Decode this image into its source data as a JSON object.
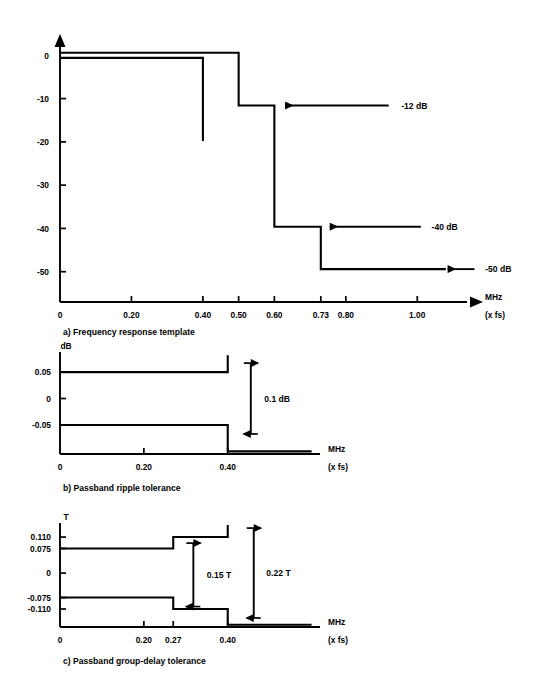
{
  "figure": {
    "title_visible": "",
    "stroke_color": "#000000",
    "background_color": "#ffffff"
  },
  "chart_data": [
    {
      "id": "a",
      "type": "line",
      "title": "a) Frequency response template",
      "caption": "a) Frequency response template",
      "xlabel": "MHz",
      "xlabel_sub": "(x fs)",
      "ylabel": "",
      "xticks": [
        0,
        0.2,
        0.4,
        0.5,
        0.6,
        0.73,
        0.8,
        1.0
      ],
      "xticklabels": [
        "0",
        "0.20",
        "0.40",
        "0.50",
        "0.60",
        "0.73",
        "0.80",
        "1.00"
      ],
      "yticks": [
        0,
        -10,
        -20,
        -30,
        -40,
        -50
      ],
      "yticklabels": [
        "0",
        "-10",
        "-20",
        "-30",
        "-40",
        "-50"
      ],
      "xlim": [
        0,
        1.1
      ],
      "ylim": [
        -57,
        4
      ],
      "grid": false,
      "legend": "none",
      "series": [
        {
          "name": "upper-mask",
          "points": [
            [
              0,
              0.6
            ],
            [
              0.5,
              0.6
            ],
            [
              0.5,
              -11.6
            ],
            [
              0.6,
              -11.6
            ],
            [
              0.6,
              -39.6
            ],
            [
              0.73,
              -39.6
            ],
            [
              0.73,
              -49.4
            ],
            [
              1.08,
              -49.4
            ]
          ]
        },
        {
          "name": "lower-mask",
          "points": [
            [
              0,
              -0.6
            ],
            [
              0.4,
              -0.6
            ],
            [
              0.4,
              -19.8
            ]
          ]
        }
      ],
      "annotations": [
        {
          "text": "-12 dB",
          "value": -12,
          "arrow_from_x": 0.92,
          "arrow_to_x": 0.63,
          "y": -11.6,
          "label_x": 0.955
        },
        {
          "text": "-40 dB",
          "value": -40,
          "arrow_from_x": 1.01,
          "arrow_to_x": 0.755,
          "y": -39.6,
          "label_x": 1.04
        },
        {
          "text": "-50 dB",
          "value": -50,
          "arrow_from_x": 1.16,
          "arrow_to_x": 1.085,
          "y": -49.4,
          "label_x": 1.19
        }
      ]
    },
    {
      "id": "b",
      "type": "line",
      "title": "b) Passband ripple tolerance",
      "caption": "b) Passband ripple tolerance",
      "xlabel": "MHz",
      "xlabel_sub": "(x fs)",
      "ylabel": "dB",
      "xticks": [
        0,
        0.2,
        0.4
      ],
      "xticklabels": [
        "0",
        "0.20",
        "0.40"
      ],
      "yticks": [
        0.05,
        0,
        -0.05
      ],
      "yticklabels": [
        "0.05",
        "0",
        "-0.05"
      ],
      "xlim": [
        0,
        0.62
      ],
      "ylim": [
        -0.105,
        0.088
      ],
      "grid": false,
      "legend": "none",
      "series": [
        {
          "name": "upper-ripple",
          "points": [
            [
              0,
              0.05
            ],
            [
              0.4,
              0.05
            ],
            [
              0.4,
              0.082
            ]
          ]
        },
        {
          "name": "lower-ripple",
          "points": [
            [
              0,
              -0.05
            ],
            [
              0.4,
              -0.05
            ],
            [
              0.4,
              -0.1
            ],
            [
              0.6,
              -0.1
            ]
          ]
        }
      ],
      "annotations": [
        {
          "text": "0.1 dB",
          "value": 0.1,
          "arrow_top_y": 0.05,
          "arrow_bottom_y": -0.05,
          "arrow_x": 0.455,
          "label_x": 0.487
        }
      ]
    },
    {
      "id": "c",
      "type": "line",
      "title": "c) Passband group-delay tolerance",
      "caption": "c) Passband group-delay tolerance",
      "xlabel": "MHz",
      "xlabel_sub": "(x fs)",
      "ylabel": "T",
      "xticks": [
        0,
        0.2,
        0.27,
        0.4
      ],
      "xticklabels": [
        "0",
        "0.20",
        "0.27",
        "0.40"
      ],
      "yticks": [
        0.11,
        0.075,
        0,
        -0.075,
        -0.11
      ],
      "yticklabels": [
        "0.110",
        "0.075",
        "0",
        "-0.075",
        "-0.110"
      ],
      "xlim": [
        0,
        0.62
      ],
      "ylim": [
        -0.165,
        0.153
      ],
      "grid": false,
      "legend": "none",
      "series": [
        {
          "name": "upper-delay",
          "points": [
            [
              0,
              0.075
            ],
            [
              0.27,
              0.075
            ],
            [
              0.27,
              0.11
            ],
            [
              0.4,
              0.11
            ],
            [
              0.4,
              0.147
            ]
          ]
        },
        {
          "name": "lower-delay",
          "points": [
            [
              0,
              -0.075
            ],
            [
              0.27,
              -0.075
            ],
            [
              0.27,
              -0.11
            ],
            [
              0.4,
              -0.11
            ],
            [
              0.4,
              -0.158
            ],
            [
              0.6,
              -0.158
            ]
          ]
        }
      ],
      "annotations": [
        {
          "text": "0.15 T",
          "value": 0.15,
          "arrow_top_y": 0.064,
          "arrow_bottom_y": -0.075,
          "arrow_x": 0.318,
          "label_x": 0.35
        },
        {
          "text": "0.22 T",
          "value": 0.22,
          "arrow_top_y": 0.11,
          "arrow_bottom_y": -0.11,
          "arrow_x": 0.462,
          "label_x": 0.492
        }
      ]
    }
  ]
}
